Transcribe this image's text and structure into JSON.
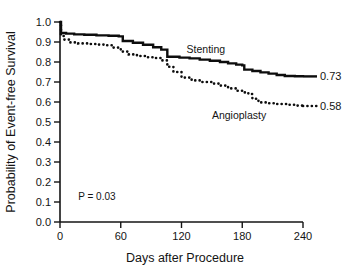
{
  "chart_data": {
    "type": "line",
    "title": "",
    "xlabel": "Days after Procedure",
    "ylabel": "Probability of Event-free Survival",
    "xlim": [
      0,
      240
    ],
    "ylim": [
      0.0,
      1.0
    ],
    "xticks": [
      0,
      60,
      120,
      180,
      240
    ],
    "xtick_labels": [
      "0",
      "60",
      "120",
      "180",
      "240"
    ],
    "yticks": [
      0.0,
      0.1,
      0.2,
      0.3,
      0.4,
      0.5,
      0.6,
      0.7,
      0.8,
      0.9,
      1.0
    ],
    "ytick_labels": [
      "0.0",
      "0.1",
      "0.2",
      "0.3",
      "0.4",
      "0.5",
      "0.6",
      "0.7",
      "0.8",
      "0.9",
      "1.0"
    ],
    "grid": false,
    "legend_position": "inline-annotations",
    "annotations": [
      {
        "name": "p-value",
        "text": "P = 0.03",
        "x_day": 18,
        "y_prob": 0.11
      },
      {
        "name": "stenting-inline-label",
        "text": "Stenting",
        "x_day": 125,
        "y_prob": 0.845
      },
      {
        "name": "angioplasty-inline-label",
        "text": "Angioplasty",
        "x_day": 150,
        "y_prob": 0.515
      }
    ],
    "series": [
      {
        "name": "Stenting",
        "style": "solid",
        "end_value_label": "0.73",
        "end_value": 0.73,
        "points": [
          [
            0,
            1.0
          ],
          [
            1,
            0.945
          ],
          [
            6,
            0.942
          ],
          [
            14,
            0.938
          ],
          [
            24,
            0.936
          ],
          [
            36,
            0.933
          ],
          [
            48,
            0.931
          ],
          [
            58,
            0.928
          ],
          [
            62,
            0.905
          ],
          [
            72,
            0.896
          ],
          [
            82,
            0.886
          ],
          [
            92,
            0.874
          ],
          [
            100,
            0.862
          ],
          [
            106,
            0.826
          ],
          [
            118,
            0.822
          ],
          [
            128,
            0.818
          ],
          [
            138,
            0.812
          ],
          [
            148,
            0.806
          ],
          [
            158,
            0.8
          ],
          [
            166,
            0.793
          ],
          [
            174,
            0.787
          ],
          [
            180,
            0.783
          ],
          [
            182,
            0.762
          ],
          [
            190,
            0.755
          ],
          [
            198,
            0.748
          ],
          [
            206,
            0.742
          ],
          [
            214,
            0.735
          ],
          [
            222,
            0.73
          ],
          [
            232,
            0.729
          ],
          [
            240,
            0.728
          ]
        ]
      },
      {
        "name": "Angioplasty",
        "style": "dotted",
        "end_value_label": "0.58",
        "end_value": 0.58,
        "points": [
          [
            0,
            1.0
          ],
          [
            1,
            0.93
          ],
          [
            4,
            0.912
          ],
          [
            10,
            0.898
          ],
          [
            18,
            0.893
          ],
          [
            28,
            0.89
          ],
          [
            38,
            0.887
          ],
          [
            46,
            0.884
          ],
          [
            52,
            0.872
          ],
          [
            60,
            0.852
          ],
          [
            68,
            0.838
          ],
          [
            76,
            0.83
          ],
          [
            86,
            0.824
          ],
          [
            94,
            0.82
          ],
          [
            100,
            0.808
          ],
          [
            106,
            0.776
          ],
          [
            112,
            0.75
          ],
          [
            120,
            0.722
          ],
          [
            130,
            0.708
          ],
          [
            140,
            0.7
          ],
          [
            150,
            0.692
          ],
          [
            158,
            0.682
          ],
          [
            166,
            0.668
          ],
          [
            174,
            0.656
          ],
          [
            180,
            0.648
          ],
          [
            186,
            0.64
          ],
          [
            190,
            0.616
          ],
          [
            196,
            0.598
          ],
          [
            204,
            0.594
          ],
          [
            214,
            0.59
          ],
          [
            224,
            0.586
          ],
          [
            232,
            0.582
          ],
          [
            240,
            0.58
          ]
        ]
      }
    ]
  }
}
